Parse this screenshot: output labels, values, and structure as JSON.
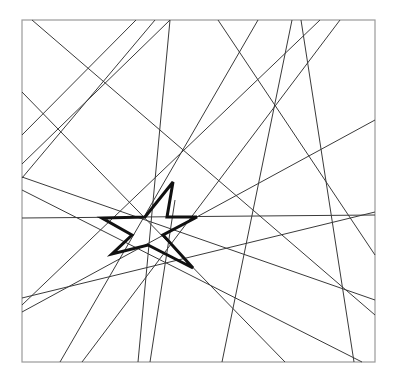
{
  "diagram": {
    "frame": {
      "x": 22,
      "y": 20,
      "width": 353,
      "height": 342,
      "stroke": "#9a9a9a"
    },
    "line_color": "#3a3a3a",
    "star_color": "#111111",
    "lines": [
      {
        "x1": 32,
        "y1": 20,
        "x2": 375,
        "y2": 315
      },
      {
        "x1": 136,
        "y1": 20,
        "x2": 22,
        "y2": 135
      },
      {
        "x1": 170,
        "y1": 20,
        "x2": 22,
        "y2": 164
      },
      {
        "x1": 155,
        "y1": 20,
        "x2": 22,
        "y2": 178
      },
      {
        "x1": 22,
        "y1": 92,
        "x2": 285,
        "y2": 362
      },
      {
        "x1": 22,
        "y1": 177,
        "x2": 375,
        "y2": 300
      },
      {
        "x1": 170,
        "y1": 20,
        "x2": 138,
        "y2": 362
      },
      {
        "x1": 218,
        "y1": 20,
        "x2": 375,
        "y2": 255
      },
      {
        "x1": 292,
        "y1": 20,
        "x2": 222,
        "y2": 362
      },
      {
        "x1": 301,
        "y1": 20,
        "x2": 354,
        "y2": 362
      },
      {
        "x1": 320,
        "y1": 20,
        "x2": 22,
        "y2": 305
      },
      {
        "x1": 22,
        "y1": 218,
        "x2": 375,
        "y2": 215
      },
      {
        "x1": 375,
        "y1": 120,
        "x2": 22,
        "y2": 312
      },
      {
        "x1": 375,
        "y1": 212,
        "x2": 22,
        "y2": 298
      },
      {
        "x1": 258,
        "y1": 20,
        "x2": 60,
        "y2": 362
      },
      {
        "x1": 22,
        "y1": 190,
        "x2": 362,
        "y2": 362
      },
      {
        "x1": 175,
        "y1": 200,
        "x2": 150,
        "y2": 362
      },
      {
        "x1": 340,
        "y1": 20,
        "x2": 82,
        "y2": 362
      }
    ],
    "star_points": [
      [
        173,
        182
      ],
      [
        167,
        217
      ],
      [
        197,
        217
      ],
      [
        163,
        235
      ],
      [
        193,
        268
      ],
      [
        148,
        245
      ],
      [
        112,
        254
      ],
      [
        132,
        235
      ],
      [
        102,
        218
      ],
      [
        145,
        217
      ]
    ]
  }
}
